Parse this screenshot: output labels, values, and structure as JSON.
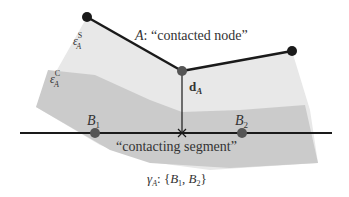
{
  "colors": {
    "background": "#ffffff",
    "region_outer": "#e6e6e6",
    "region_inner": "#c9c9c9",
    "edge": "#1a1a1a",
    "node_dark": "#1a1a1a",
    "node_grey": "#555555",
    "label": "#333333"
  },
  "labels": {
    "node_A_prefix": "A",
    "node_A_text": ": “contacted node”",
    "eps_s_base": "ε",
    "eps_s_sup": "S",
    "eps_s_sub": "A",
    "eps_c_base": "ε",
    "eps_c_sup": "C",
    "eps_c_sub": "A",
    "d_base": "d",
    "d_sub": "A",
    "b1_base": "B",
    "b1_sub": "1",
    "b2_base": "B",
    "b2_sub": "2",
    "segment_text": "“contacting segment”",
    "gamma_base": "γ",
    "gamma_sub": "A",
    "gamma_rest_1": ": {",
    "gamma_b1": "B",
    "gamma_b1_sub": "1",
    "gamma_comma": ", ",
    "gamma_b2": "B",
    "gamma_b2_sub": "2",
    "gamma_close": "}"
  }
}
